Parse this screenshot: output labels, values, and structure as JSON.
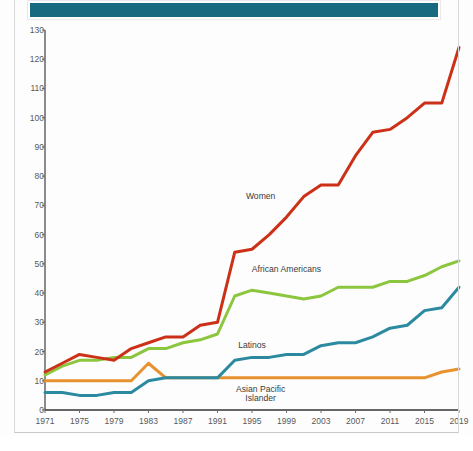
{
  "banner": {
    "name": "header-banner",
    "text": "",
    "color": "#176a80"
  },
  "colors": {
    "women": "#cc3118",
    "african_americans": "#8cc63e",
    "latinos": "#2b8aa0",
    "asian_pacific_islander": "#e8912f",
    "axis": "#6d6e71",
    "tick_text": "#58595b",
    "background": "#fdfdfd"
  },
  "chart_data": {
    "type": "line",
    "title": "",
    "xlabel": "",
    "ylabel": "",
    "xlim": [
      1971,
      2019
    ],
    "ylim": [
      0,
      130
    ],
    "ytick_step": 10,
    "xtick_step": 4,
    "grid": false,
    "legend_position": "inline-annotations",
    "yticks": [
      0,
      10,
      20,
      30,
      40,
      50,
      60,
      70,
      80,
      90,
      100,
      110,
      120,
      130
    ],
    "xticks": [
      1971,
      1975,
      1979,
      1983,
      1987,
      1991,
      1995,
      1999,
      2003,
      2007,
      2011,
      2015,
      2019
    ],
    "x": [
      1971,
      1973,
      1975,
      1977,
      1979,
      1981,
      1983,
      1985,
      1987,
      1989,
      1991,
      1993,
      1995,
      1997,
      1999,
      2001,
      2003,
      2005,
      2007,
      2009,
      2011,
      2013,
      2015,
      2017,
      2019
    ],
    "series": [
      {
        "name": "Women",
        "color": "#cc3118",
        "label": "Women",
        "label_x": 1996,
        "label_y": 73,
        "values": [
          13,
          16,
          19,
          18,
          17,
          21,
          23,
          25,
          25,
          29,
          30,
          54,
          55,
          60,
          66,
          73,
          77,
          77,
          87,
          95,
          96,
          100,
          105,
          105,
          124
        ]
      },
      {
        "name": "African Americans",
        "color": "#8cc63e",
        "label": "African Americans",
        "label_x": 1999,
        "label_y": 48,
        "values": [
          12,
          15,
          17,
          17,
          18,
          18,
          21,
          21,
          23,
          24,
          26,
          39,
          41,
          40,
          39,
          38,
          39,
          42,
          42,
          42,
          44,
          44,
          46,
          49,
          51
        ]
      },
      {
        "name": "Latinos",
        "color": "#2b8aa0",
        "label": "Latinos",
        "label_x": 1995,
        "label_y": 22,
        "values": [
          6,
          6,
          5,
          5,
          6,
          6,
          10,
          11,
          11,
          11,
          11,
          17,
          18,
          18,
          19,
          19,
          22,
          23,
          23,
          25,
          28,
          29,
          34,
          35,
          42
        ]
      },
      {
        "name": "Asian Pacific Islander",
        "color": "#e8912f",
        "label": "Asian Pacific Islander",
        "label_line1": "Asian Pacific",
        "label_line2": "Islander",
        "label_x": 1996,
        "label_y": 7,
        "values": [
          10,
          10,
          10,
          10,
          10,
          10,
          16,
          11,
          11,
          11,
          11,
          11,
          11,
          11,
          11,
          11,
          11,
          11,
          11,
          11,
          11,
          11,
          11,
          13,
          14
        ]
      }
    ]
  }
}
